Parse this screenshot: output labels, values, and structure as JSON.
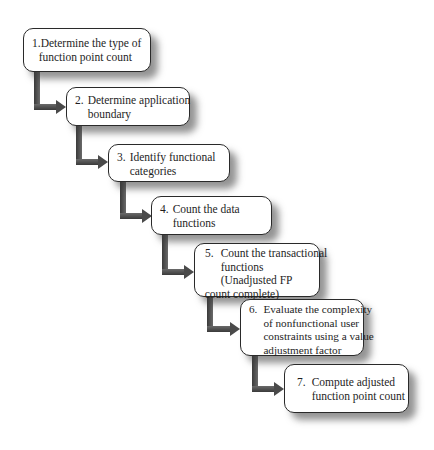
{
  "diagram": {
    "type": "staircase-process-flow",
    "connector_color": "#4a4a4a",
    "steps": [
      {
        "number": "1.",
        "lines": [
          "Determine the type of",
          "function point count"
        ]
      },
      {
        "number": "2.",
        "lines": [
          "Determine application",
          "boundary"
        ]
      },
      {
        "number": "3.",
        "lines": [
          "Identify functional",
          "categories"
        ]
      },
      {
        "number": "4.",
        "lines": [
          "Count the data",
          "functions"
        ]
      },
      {
        "number": "5.",
        "lines": [
          "Count the transactional",
          "functions",
          "(Unadjusted FP",
          "count complete)"
        ]
      },
      {
        "number": "6.",
        "lines": [
          "Evaluate the complexity",
          "of nonfunctional user",
          "constraints using  a value",
          "adjustment factor"
        ]
      },
      {
        "number": "7.",
        "lines": [
          "Compute adjusted",
          "function point count"
        ]
      }
    ]
  }
}
